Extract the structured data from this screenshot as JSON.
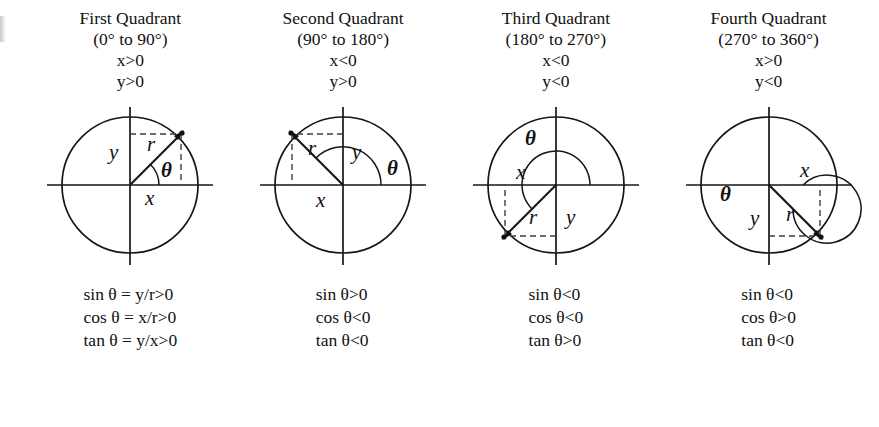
{
  "figure": {
    "edge_mark": "",
    "quadrants": [
      {
        "id": "first",
        "title": "First Quadrant",
        "range": "(0° to 90°)",
        "sign_x": "x>0",
        "sign_y": "y>0",
        "diagram_labels": {
          "y": "y",
          "r": "r",
          "theta": "θ",
          "x": "x"
        },
        "formulas": [
          "sin θ = y/r>0",
          "cos θ = x/r>0",
          "tan θ = y/x>0"
        ]
      },
      {
        "id": "second",
        "title": "Second Quadrant",
        "range": "(90° to 180°)",
        "sign_x": "x<0",
        "sign_y": "y>0",
        "diagram_labels": {
          "y": "y",
          "r": "r",
          "theta": "θ",
          "x": "x"
        },
        "formulas": [
          "sin θ>0",
          "cos θ<0",
          "tan θ<0"
        ]
      },
      {
        "id": "third",
        "title": "Third Quadrant",
        "range": "(180° to 270°)",
        "sign_x": "x<0",
        "sign_y": "y<0",
        "diagram_labels": {
          "y": "y",
          "r": "r",
          "theta": "θ",
          "x": "x"
        },
        "formulas": [
          "sin θ<0",
          "cos θ<0",
          "tan θ>0"
        ]
      },
      {
        "id": "fourth",
        "title": "Fourth Quadrant",
        "range": "(270° to 360°)",
        "sign_x": "x>0",
        "sign_y": "y<0",
        "diagram_labels": {
          "y": "y",
          "r": "r",
          "theta": "θ",
          "x": "x"
        },
        "formulas": [
          "sin θ<0",
          "cos θ>0",
          "tan θ<0"
        ]
      }
    ],
    "colors": {
      "ink": "#161616",
      "dash": "#3d3d3d",
      "background": "#ffffff"
    }
  }
}
